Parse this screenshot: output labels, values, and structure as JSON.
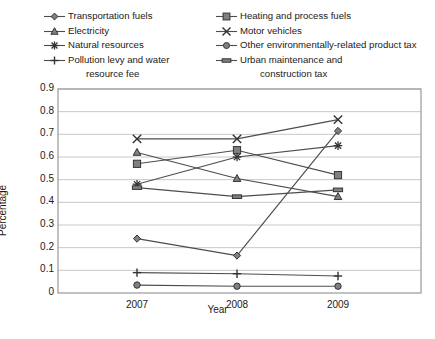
{
  "chart_data": {
    "type": "line",
    "title": "",
    "xlabel": "Year",
    "ylabel": "Percentage",
    "categories": [
      "2007",
      "2008",
      "2009"
    ],
    "x": [
      2007,
      2008,
      2009
    ],
    "ylim": [
      0,
      0.9
    ],
    "ytick_labels": [
      "0",
      "0.1",
      "0.2",
      "0.3",
      "0.4",
      "0.5",
      "0.6",
      "0.7",
      "0.8",
      "0.9"
    ],
    "ytick_values": [
      0,
      0.1,
      0.2,
      0.3,
      0.4,
      0.5,
      0.6,
      0.7,
      0.8,
      0.9
    ],
    "grid": true,
    "legend_position": "top",
    "series": [
      {
        "name": "Transportation fuels",
        "marker": "diamond",
        "values": [
          0.24,
          0.165,
          0.715
        ]
      },
      {
        "name": "Heating and process fuels",
        "marker": "square",
        "values": [
          0.57,
          0.63,
          0.52
        ]
      },
      {
        "name": "Electricity",
        "marker": "triangle",
        "values": [
          0.62,
          0.505,
          0.425
        ]
      },
      {
        "name": "Motor vehicles",
        "marker": "x",
        "values": [
          0.68,
          0.68,
          0.765
        ]
      },
      {
        "name": "Natural resources",
        "marker": "star",
        "values": [
          0.48,
          0.6,
          0.65
        ]
      },
      {
        "name": "Other environmentally-related product tax",
        "marker": "circle",
        "values": [
          0.035,
          0.03,
          0.03
        ]
      },
      {
        "name": "Pollution levy and water resource fee",
        "marker": "plus",
        "values": [
          0.09,
          0.085,
          0.075
        ]
      },
      {
        "name": "Urban maintenance and construction tax",
        "marker": "dash",
        "values": [
          0.465,
          0.425,
          0.455
        ]
      }
    ]
  },
  "legend": {
    "left": [
      {
        "label": "Transportation fuels",
        "marker": "diamond",
        "cont": null
      },
      {
        "label": "Electricity",
        "marker": "triangle",
        "cont": null
      },
      {
        "label": "Natural resources",
        "marker": "star",
        "cont": null
      },
      {
        "label": "Pollution levy and water",
        "marker": "plus",
        "cont": "resource fee"
      }
    ],
    "right": [
      {
        "label": "Heating and process fuels",
        "marker": "square",
        "cont": null
      },
      {
        "label": "Motor vehicles",
        "marker": "x",
        "cont": null
      },
      {
        "label": "Other environmentally-related product tax",
        "marker": "circle",
        "cont": null
      },
      {
        "label": "Urban maintenance and",
        "marker": "dash",
        "cont": "construction tax"
      }
    ]
  },
  "colors": {
    "line": "#4d4d4d",
    "marker_fill": "#808080",
    "marker_stroke": "#333333",
    "grid": "#c8c8c8",
    "frame": "#999999",
    "text": "#1a1a1a",
    "background": "#ffffff"
  }
}
